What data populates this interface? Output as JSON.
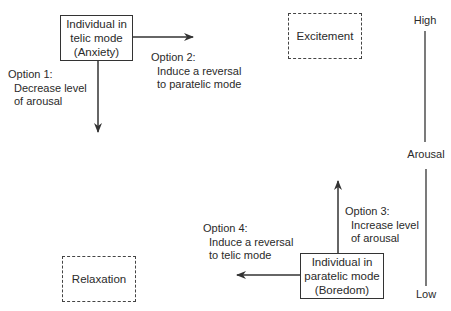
{
  "boxes": {
    "telic": {
      "lines": [
        "Individual in",
        "telic mode",
        "(Anxiety)"
      ]
    },
    "paratelic": {
      "lines": [
        "Individual in",
        "paratelic mode",
        "(Boredom)"
      ]
    },
    "excitement": {
      "label": "Excitement"
    },
    "relaxation": {
      "label": "Relaxation"
    }
  },
  "options": {
    "option1": {
      "title": "Option 1:",
      "lines": [
        "Decrease level",
        "of arousal"
      ]
    },
    "option2": {
      "title": "Option 2:",
      "lines": [
        "Induce a reversal",
        "to paratelic mode"
      ]
    },
    "option3": {
      "title": "Option 3:",
      "lines": [
        "Increase level",
        "of arousal"
      ]
    },
    "option4": {
      "title": "Option 4:",
      "lines": [
        "Induce a reversal",
        "to telic mode"
      ]
    }
  },
  "axis": {
    "high": "High",
    "label": "Arousal",
    "low": "Low"
  }
}
